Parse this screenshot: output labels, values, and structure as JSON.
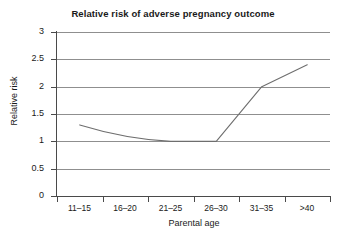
{
  "chart_data": {
    "type": "line",
    "title": "Relative risk of adverse pregnancy outcome",
    "xlabel": "Parental age",
    "ylabel": "Relative risk",
    "categories": [
      "11–15",
      "16–20",
      "21–25",
      "26–30",
      "31–35",
      ">40"
    ],
    "values": [
      1.3,
      1.1,
      1.0,
      1.0,
      2.0,
      2.4
    ],
    "series": [
      {
        "name": "Relative risk",
        "values": [
          1.3,
          1.1,
          1.0,
          1.0,
          2.0,
          2.4
        ]
      }
    ],
    "yticks": [
      "0",
      "0.5",
      "1",
      "1.5",
      "2",
      "2.5",
      "3"
    ],
    "ytick_values": [
      0,
      0.5,
      1,
      1.5,
      2,
      2.5,
      3
    ],
    "ylim": [
      0,
      3
    ],
    "grid": "horizontal",
    "legend": "none",
    "line_color": "#6e6e6e",
    "grid_color": "#8f8f8f",
    "axis_color": "#4a4a4a",
    "background": "#ffffff"
  }
}
